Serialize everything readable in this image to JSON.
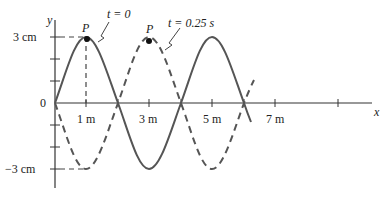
{
  "diagram": {
    "type": "transverse-wave-snapshot",
    "axes": {
      "x_label": "x",
      "y_label": "y",
      "origin_label": "0",
      "x_ticks": [
        "1 m",
        "3 m",
        "5 m",
        "7 m"
      ],
      "y_ticks": [
        "3 cm",
        "−3 cm"
      ]
    },
    "curves": [
      {
        "name": "t = 0",
        "style": "solid",
        "label": "t = 0",
        "peak_label": "P"
      },
      {
        "name": "t = 0.25 s",
        "style": "dashed",
        "label": "t = 0.25 s",
        "peak_label": "P"
      }
    ],
    "amplitude": "3 cm",
    "wavelength": "4 m",
    "line_color": "#555555"
  }
}
